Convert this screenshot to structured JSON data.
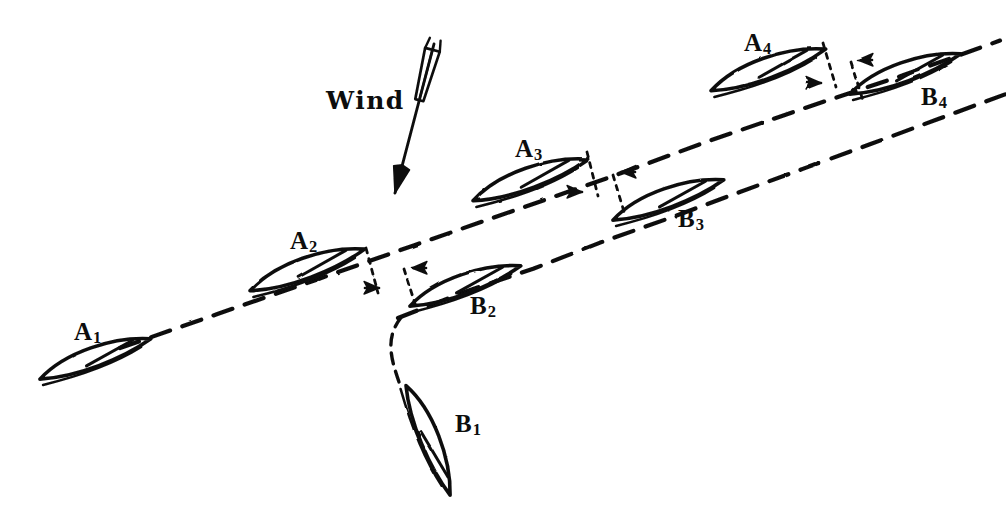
{
  "figure": {
    "kind": "hand-drawn-diagram",
    "background_color": "#ffffff",
    "ink_color": "#0d0d0d"
  },
  "wind": {
    "label": "Wind",
    "label_x": 326,
    "label_y": 88,
    "arrow_from_x": 434,
    "arrow_from_y": 44,
    "arrow_to_x": 395,
    "arrow_to_y": 193,
    "direction_degrees_from_north": 195,
    "icon": "fletched-arrow-icon"
  },
  "tracks": [
    {
      "name": "track-A",
      "style": "long-dash",
      "from_x": 120,
      "from_y": 348,
      "to_x": 1000,
      "to_y": 40,
      "dash": "20 13"
    },
    {
      "name": "track-B",
      "style": "long-dash",
      "from_x": 398,
      "from_y": 318,
      "to_x": 1006,
      "to_y": 95,
      "dash": "20 13"
    },
    {
      "name": "track-B-start-curve",
      "style": "short-dash",
      "from_x": 399,
      "from_y": 382,
      "to_x": 400,
      "to_y": 312,
      "dash": "11 8"
    }
  ],
  "boats": [
    {
      "id": "A1",
      "label": "A",
      "subscript": "1",
      "cx": 95,
      "cy": 358,
      "len": 118,
      "beam": 31,
      "angle": -19,
      "label_x": 74,
      "label_y": 319
    },
    {
      "id": "A2",
      "label": "A",
      "subscript": "2",
      "cx": 307,
      "cy": 269,
      "len": 122,
      "beam": 33,
      "angle": -19,
      "label_x": 290,
      "label_y": 228
    },
    {
      "id": "A3",
      "label": "A",
      "subscript": "3",
      "cx": 530,
      "cy": 179,
      "len": 122,
      "beam": 33,
      "angle": -19,
      "label_x": 515,
      "label_y": 136
    },
    {
      "id": "A4",
      "label": "A",
      "subscript": "4",
      "cx": 768,
      "cy": 69,
      "len": 122,
      "beam": 33,
      "angle": -19,
      "label_x": 744,
      "label_y": 30
    },
    {
      "id": "B1",
      "label": "B",
      "subscript": "1",
      "cx": 429,
      "cy": 440,
      "len": 118,
      "beam": 30,
      "angle": 69,
      "label_x": 455,
      "label_y": 411
    },
    {
      "id": "B2",
      "label": "B",
      "subscript": "2",
      "cx": 465,
      "cy": 285,
      "len": 118,
      "beam": 31,
      "angle": -19,
      "label_x": 470,
      "label_y": 293
    },
    {
      "id": "B3",
      "label": "B",
      "subscript": "3",
      "cx": 668,
      "cy": 199,
      "len": 118,
      "beam": 31,
      "angle": -19,
      "label_x": 678,
      "label_y": 206
    },
    {
      "id": "B4",
      "label": "B",
      "subscript": "4",
      "cx": 905,
      "cy": 73,
      "len": 118,
      "beam": 31,
      "angle": -19,
      "label_x": 921,
      "label_y": 84
    }
  ],
  "gap_markers": [
    {
      "name": "gap-A2-B2",
      "leader_a": {
        "x1": 366,
        "y1": 248,
        "x2": 378,
        "y2": 293
      },
      "leader_b": {
        "x1": 404,
        "y1": 269,
        "x2": 417,
        "y2": 310
      },
      "arrow_left": {
        "x": 379,
        "y": 288,
        "dir": "right"
      },
      "arrow_right": {
        "x": 412,
        "y": 268,
        "dir": "left"
      }
    },
    {
      "name": "gap-A3-B3",
      "leader_a": {
        "x1": 587,
        "y1": 152,
        "x2": 598,
        "y2": 196
      },
      "leader_b": {
        "x1": 613,
        "y1": 175,
        "x2": 625,
        "y2": 215
      },
      "arrow_left": {
        "x": 582,
        "y": 192,
        "dir": "right"
      },
      "arrow_right": {
        "x": 621,
        "y": 172,
        "dir": "left"
      }
    },
    {
      "name": "gap-A4-B4",
      "leader_a": {
        "x1": 823,
        "y1": 43,
        "x2": 836,
        "y2": 87
      },
      "leader_b": {
        "x1": 851,
        "y1": 62,
        "x2": 864,
        "y2": 104
      },
      "arrow_left": {
        "x": 821,
        "y": 83,
        "dir": "right"
      },
      "arrow_right": {
        "x": 858,
        "y": 60,
        "dir": "left"
      }
    }
  ]
}
